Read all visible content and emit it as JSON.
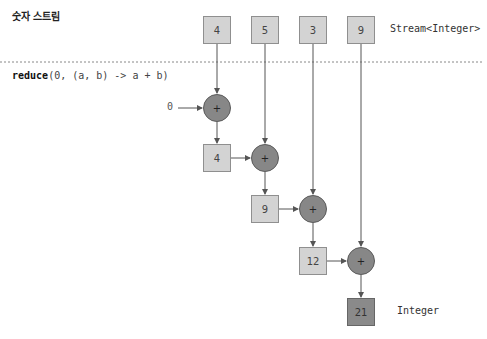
{
  "header": {
    "title": "숫자 스트림"
  },
  "stream": {
    "label": "Stream<Integer>",
    "elements": [
      "4",
      "5",
      "3",
      "9"
    ]
  },
  "operation": {
    "keyword": "reduce",
    "args": "(0, (a, b) -> a + b)",
    "initial": "0",
    "operator": "+"
  },
  "intermediate_results": [
    "4",
    "9",
    "12"
  ],
  "result": {
    "value": "21",
    "label": "Integer"
  },
  "colors": {
    "box_fill": "#d3d3d3",
    "box_border": "#8f8f8f",
    "operator_fill": "#878787",
    "result_fill": "#8a8a8a",
    "line": "#555555"
  }
}
